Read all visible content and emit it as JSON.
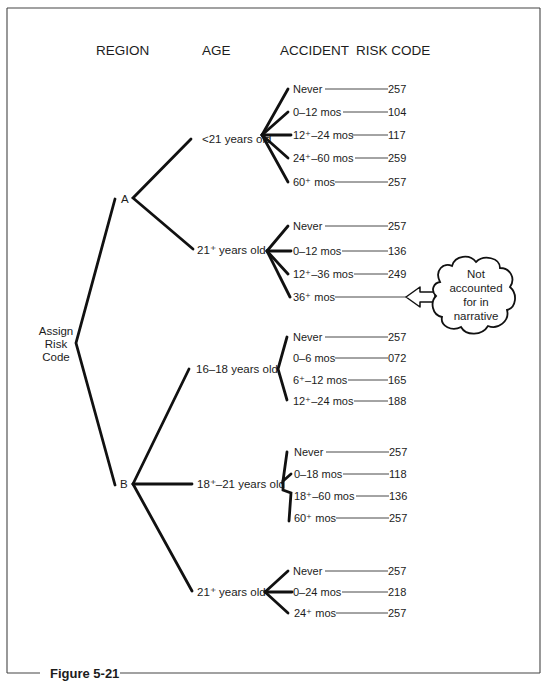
{
  "figure": {
    "caption": "Figure 5-21",
    "headers": {
      "region": "REGION",
      "age": "AGE",
      "accident": "ACCIDENT",
      "risk_code": "RISK CODE"
    },
    "root": {
      "line1": "Assign",
      "line2": "Risk",
      "line3": "Code"
    },
    "regions": [
      {
        "label": "A",
        "ages": [
          {
            "label": "<21 years old",
            "accidents": [
              {
                "label": "Never",
                "code": "257"
              },
              {
                "label": "0–12 mos",
                "code": "104"
              },
              {
                "label": "12⁺–24 mos",
                "code": "117"
              },
              {
                "label": "24⁺–60 mos",
                "code": "259"
              },
              {
                "label": "60⁺ mos",
                "code": "257"
              }
            ]
          },
          {
            "label": "21⁺ years old",
            "accidents": [
              {
                "label": "Never",
                "code": "257"
              },
              {
                "label": "0–12 mos",
                "code": "136"
              },
              {
                "label": "12⁺–36 mos",
                "code": "249"
              },
              {
                "label": "36⁺ mos",
                "code": ""
              }
            ]
          }
        ]
      },
      {
        "label": "B",
        "ages": [
          {
            "label": "16–18 years old",
            "accidents": [
              {
                "label": "Never",
                "code": "257"
              },
              {
                "label": "0–6 mos",
                "code": "072"
              },
              {
                "label": "6⁺–12 mos",
                "code": "165"
              },
              {
                "label": "12⁺–24 mos",
                "code": "188"
              }
            ]
          },
          {
            "label": "18⁺–21 years old",
            "accidents": [
              {
                "label": "Never",
                "code": "257"
              },
              {
                "label": "0–18 mos",
                "code": "118"
              },
              {
                "label": "18⁺–60 mos",
                "code": "136"
              },
              {
                "label": "60⁺ mos",
                "code": "257"
              }
            ]
          },
          {
            "label": "21⁺ years old",
            "accidents": [
              {
                "label": "Never",
                "code": "257"
              },
              {
                "label": "0–24 mos",
                "code": "218"
              },
              {
                "label": "24⁺ mos",
                "code": "257"
              }
            ]
          }
        ]
      }
    ],
    "callout": {
      "line1": "Not",
      "line2": "accounted",
      "line3": "for in",
      "line4": "narrative",
      "icon": "cloud-callout-arrow-left"
    }
  }
}
